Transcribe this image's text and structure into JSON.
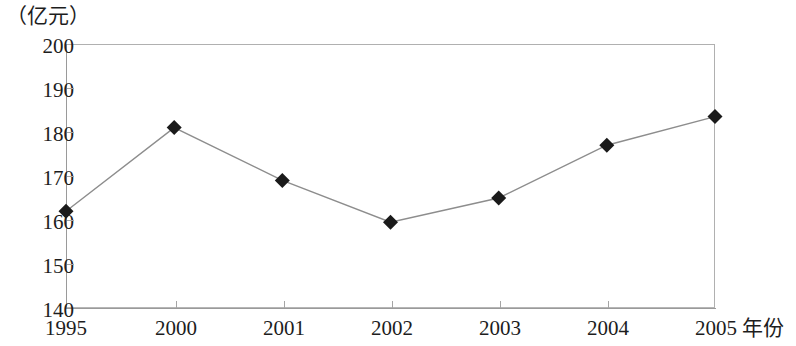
{
  "chart_data": {
    "type": "line",
    "title": "",
    "unit_label": "（亿元）",
    "xlabel": "年份",
    "ylabel": "",
    "categories": [
      "1995",
      "2000",
      "2001",
      "2002",
      "2003",
      "2004",
      "2005"
    ],
    "values": [
      162,
      181,
      169,
      159.5,
      165,
      177,
      183.5
    ],
    "series": [
      {
        "name": "",
        "values": [
          162,
          181,
          169,
          159.5,
          165,
          177,
          183.5
        ]
      }
    ],
    "ylim": [
      140,
      200
    ],
    "yticks": [
      140,
      150,
      160,
      170,
      180,
      190,
      200
    ],
    "ytick_labels": [
      "140",
      "150",
      "160",
      "170",
      "180",
      "190",
      "200"
    ],
    "xtick_labels": [
      "1995",
      "2000",
      "2001",
      "2002",
      "2003",
      "2004",
      "2005"
    ],
    "grid": false,
    "legend": null,
    "marker": "diamond",
    "marker_color": "#1a1a1a",
    "line_color": "#8d8d8d",
    "frame_color": "#b0b0b0"
  },
  "axes": {
    "unit_label": "（亿元）",
    "x_axis_title": "年份"
  }
}
